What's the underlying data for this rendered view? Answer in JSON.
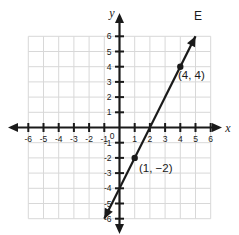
{
  "chart_data": {
    "type": "line",
    "title": "",
    "xlabel": "x",
    "ylabel": "y",
    "xlim": [
      -6,
      6
    ],
    "ylim": [
      -6,
      6
    ],
    "grid": true,
    "legend": "none",
    "x_ticks": [
      "-6",
      "-5",
      "-4",
      "-3",
      "-2",
      "-1",
      "1",
      "2",
      "3",
      "4",
      "5",
      "6"
    ],
    "y_ticks": [
      "6",
      "5",
      "4",
      "3",
      "2",
      "1",
      "-1",
      "-2",
      "-3",
      "-4",
      "-5",
      "-6"
    ],
    "origin_label": "0",
    "series": [
      {
        "name": "E",
        "label": "E",
        "slope": 2,
        "intercept": -4,
        "x_endpoints": [
          -1.0,
          5.0
        ],
        "points": [
          {
            "x": 1,
            "y": -2,
            "label": "(1, −2)"
          },
          {
            "x": 4,
            "y": 4,
            "label": "(4, 4)"
          }
        ]
      }
    ]
  },
  "axes": {
    "x_axis_name": "x",
    "y_axis_name": "y",
    "origin": "0"
  },
  "x_tick_labels": [
    {
      "value": -6,
      "text": "-6"
    },
    {
      "value": -5,
      "text": "-5"
    },
    {
      "value": -4,
      "text": "-4"
    },
    {
      "value": -3,
      "text": "-3"
    },
    {
      "value": -2,
      "text": "-2"
    },
    {
      "value": -1,
      "text": "-1"
    },
    {
      "value": 1,
      "text": "1"
    },
    {
      "value": 2,
      "text": "2"
    },
    {
      "value": 3,
      "text": "3"
    },
    {
      "value": 4,
      "text": "4"
    },
    {
      "value": 5,
      "text": "5"
    },
    {
      "value": 6,
      "text": "6"
    }
  ],
  "y_tick_labels": [
    {
      "value": 6,
      "text": "6"
    },
    {
      "value": 5,
      "text": "5"
    },
    {
      "value": 4,
      "text": "4"
    },
    {
      "value": 3,
      "text": "3"
    },
    {
      "value": 2,
      "text": "2"
    },
    {
      "value": 1,
      "text": "1"
    },
    {
      "value": -1,
      "text": "-1"
    },
    {
      "value": -2,
      "text": "-2"
    },
    {
      "value": -3,
      "text": "-3"
    },
    {
      "value": -4,
      "text": "-4"
    },
    {
      "value": -5,
      "text": "-5"
    },
    {
      "value": -6,
      "text": "-6"
    }
  ],
  "annotations": {
    "line_label": "E",
    "point_a_label": "(4, 4)",
    "point_b_label": "(1, −2)"
  },
  "colors": {
    "background": "#ffffff",
    "grid": "#d8d8d8",
    "axis": "#1a1a1a",
    "line": "#1a1a1a",
    "text": "#1a1a1a"
  }
}
